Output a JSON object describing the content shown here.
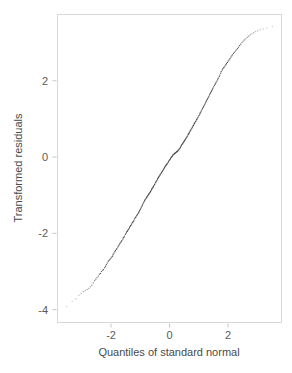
{
  "chart_data": {
    "type": "scatter",
    "title": "",
    "subtitle": "",
    "xlabel": "Quantiles of standard normal",
    "ylabel": "Transformed residuals",
    "xlim": [
      -3.85,
      3.85
    ],
    "ylim": [
      -4.35,
      3.75
    ],
    "xticks": [
      -2,
      0,
      2
    ],
    "xtick_labels": [
      "-2",
      "0",
      "2"
    ],
    "yticks": [
      2,
      0,
      -2,
      -4
    ],
    "ytick_labels": [
      "2",
      "0",
      "-2",
      "-4"
    ],
    "grid": false,
    "legend": null,
    "legend_position": "none",
    "annotations": [],
    "series": [
      {
        "name": "Transformed residuals vs normal quantiles",
        "marker": "point",
        "color": "#3b3b3b",
        "x": [
          -3.52,
          -3.33,
          -3.2,
          -3.1,
          -3.02,
          -2.95,
          -2.88,
          -2.82,
          -2.76,
          -2.71,
          -2.66,
          -2.61,
          -2.56,
          -2.52,
          -2.48,
          -2.44,
          -2.4,
          -2.36,
          -2.33,
          -2.29,
          -2.26,
          -2.22,
          -2.19,
          -2.16,
          -2.13,
          -2.1,
          -2.07,
          -2.04,
          -2.01,
          -1.98,
          -1.95,
          -1.93,
          -1.9,
          -1.87,
          -1.85,
          -1.82,
          -1.8,
          -1.77,
          -1.75,
          -1.72,
          -1.7,
          -1.67,
          -1.65,
          -1.63,
          -1.6,
          -1.58,
          -1.56,
          -1.54,
          -1.51,
          -1.49,
          -1.47,
          -1.45,
          -1.43,
          -1.41,
          -1.39,
          -1.37,
          -1.35,
          -1.33,
          -1.31,
          -1.29,
          -1.27,
          -1.25,
          -1.23,
          -1.21,
          -1.19,
          -1.17,
          -1.15,
          -1.13,
          -1.11,
          -1.09,
          -1.07,
          -1.05,
          -1.04,
          -1.02,
          -1.0,
          -0.98,
          -0.96,
          -0.94,
          -0.93,
          -0.91,
          -0.89,
          -0.87,
          -0.85,
          -0.84,
          -0.82,
          -0.8,
          -0.78,
          -0.77,
          -0.75,
          -0.73,
          -0.71,
          -0.7,
          -0.68,
          -0.66,
          -0.65,
          -0.63,
          -0.61,
          -0.6,
          -0.58,
          -0.56,
          -0.55,
          -0.53,
          -0.51,
          -0.5,
          -0.48,
          -0.46,
          -0.45,
          -0.43,
          -0.41,
          -0.4,
          -0.38,
          -0.37,
          -0.35,
          -0.33,
          -0.32,
          -0.3,
          -0.28,
          -0.27,
          -0.25,
          -0.24,
          -0.22,
          -0.2,
          -0.19,
          -0.17,
          -0.16,
          -0.14,
          -0.12,
          -0.11,
          -0.09,
          -0.08,
          -0.06,
          -0.04,
          -0.03,
          -0.01,
          0.01,
          0.03,
          0.04,
          0.06,
          0.08,
          0.09,
          0.11,
          0.12,
          0.14,
          0.16,
          0.17,
          0.19,
          0.2,
          0.22,
          0.24,
          0.25,
          0.27,
          0.28,
          0.3,
          0.32,
          0.33,
          0.35,
          0.37,
          0.38,
          0.4,
          0.41,
          0.43,
          0.45,
          0.46,
          0.48,
          0.5,
          0.51,
          0.53,
          0.55,
          0.56,
          0.58,
          0.6,
          0.61,
          0.63,
          0.65,
          0.66,
          0.68,
          0.7,
          0.71,
          0.73,
          0.75,
          0.77,
          0.78,
          0.8,
          0.82,
          0.84,
          0.85,
          0.87,
          0.89,
          0.91,
          0.93,
          0.94,
          0.96,
          0.98,
          1.0,
          1.02,
          1.04,
          1.05,
          1.07,
          1.09,
          1.11,
          1.13,
          1.15,
          1.17,
          1.19,
          1.21,
          1.23,
          1.25,
          1.27,
          1.29,
          1.31,
          1.33,
          1.35,
          1.37,
          1.39,
          1.41,
          1.43,
          1.45,
          1.47,
          1.49,
          1.51,
          1.54,
          1.56,
          1.58,
          1.6,
          1.63,
          1.65,
          1.67,
          1.7,
          1.72,
          1.75,
          1.77,
          1.8,
          1.82,
          1.85,
          1.87,
          1.9,
          1.93,
          1.95,
          1.98,
          2.01,
          2.04,
          2.07,
          2.1,
          2.13,
          2.16,
          2.19,
          2.22,
          2.26,
          2.29,
          2.33,
          2.36,
          2.4,
          2.44,
          2.48,
          2.52,
          2.56,
          2.61,
          2.66,
          2.71,
          2.76,
          2.82,
          2.88,
          2.95,
          3.02,
          3.1,
          3.2,
          3.33,
          3.52
        ],
        "y": [
          -3.92,
          -3.78,
          -3.72,
          -3.62,
          -3.58,
          -3.53,
          -3.5,
          -3.47,
          -3.44,
          -3.4,
          -3.36,
          -3.3,
          -3.24,
          -3.2,
          -3.16,
          -3.12,
          -3.07,
          -3.05,
          -3.0,
          -2.97,
          -2.95,
          -2.9,
          -2.86,
          -2.82,
          -2.78,
          -2.74,
          -2.71,
          -2.68,
          -2.65,
          -2.62,
          -2.6,
          -2.56,
          -2.52,
          -2.48,
          -2.45,
          -2.42,
          -2.4,
          -2.36,
          -2.33,
          -2.3,
          -2.27,
          -2.24,
          -2.21,
          -2.19,
          -2.15,
          -2.12,
          -2.1,
          -2.07,
          -2.03,
          -2.0,
          -1.97,
          -1.95,
          -1.93,
          -1.9,
          -1.88,
          -1.85,
          -1.82,
          -1.8,
          -1.78,
          -1.75,
          -1.72,
          -1.7,
          -1.68,
          -1.65,
          -1.62,
          -1.59,
          -1.57,
          -1.54,
          -1.52,
          -1.5,
          -1.47,
          -1.45,
          -1.43,
          -1.4,
          -1.37,
          -1.34,
          -1.31,
          -1.28,
          -1.26,
          -1.23,
          -1.2,
          -1.17,
          -1.14,
          -1.12,
          -1.1,
          -1.08,
          -1.06,
          -1.04,
          -1.02,
          -1.0,
          -0.98,
          -0.96,
          -0.94,
          -0.92,
          -0.9,
          -0.88,
          -0.85,
          -0.83,
          -0.81,
          -0.79,
          -0.77,
          -0.74,
          -0.72,
          -0.7,
          -0.67,
          -0.65,
          -0.63,
          -0.61,
          -0.58,
          -0.56,
          -0.54,
          -0.52,
          -0.5,
          -0.48,
          -0.46,
          -0.44,
          -0.42,
          -0.4,
          -0.38,
          -0.36,
          -0.34,
          -0.32,
          -0.3,
          -0.28,
          -0.26,
          -0.24,
          -0.22,
          -0.2,
          -0.19,
          -0.17,
          -0.15,
          -0.13,
          -0.11,
          -0.09,
          -0.07,
          -0.05,
          -0.03,
          -0.01,
          0.01,
          0.02,
          0.04,
          0.06,
          0.07,
          0.08,
          0.09,
          0.1,
          0.11,
          0.12,
          0.13,
          0.14,
          0.15,
          0.16,
          0.18,
          0.19,
          0.21,
          0.23,
          0.25,
          0.27,
          0.29,
          0.31,
          0.33,
          0.35,
          0.37,
          0.39,
          0.41,
          0.43,
          0.45,
          0.47,
          0.49,
          0.51,
          0.53,
          0.55,
          0.58,
          0.6,
          0.62,
          0.64,
          0.67,
          0.69,
          0.71,
          0.74,
          0.76,
          0.78,
          0.81,
          0.83,
          0.86,
          0.88,
          0.9,
          0.93,
          0.95,
          0.98,
          1.0,
          1.03,
          1.05,
          1.08,
          1.1,
          1.13,
          1.16,
          1.18,
          1.21,
          1.24,
          1.27,
          1.3,
          1.33,
          1.36,
          1.39,
          1.42,
          1.45,
          1.48,
          1.51,
          1.54,
          1.57,
          1.6,
          1.63,
          1.66,
          1.69,
          1.72,
          1.75,
          1.78,
          1.81,
          1.84,
          1.88,
          1.91,
          1.94,
          1.97,
          2.0,
          2.04,
          2.07,
          2.11,
          2.15,
          2.2,
          2.24,
          2.28,
          2.31,
          2.34,
          2.36,
          2.39,
          2.42,
          2.45,
          2.48,
          2.52,
          2.55,
          2.58,
          2.62,
          2.65,
          2.68,
          2.72,
          2.75,
          2.78,
          2.81,
          2.84,
          2.88,
          2.92,
          2.96,
          3.0,
          3.04,
          3.07,
          3.1,
          3.14,
          3.17,
          3.2,
          3.23,
          3.26,
          3.29,
          3.31,
          3.34,
          3.36,
          3.38,
          3.42
        ]
      }
    ]
  },
  "plot": {
    "frame": {
      "left": 57,
      "top": 14,
      "right": 282,
      "bottom": 323
    },
    "background_color": "#ffffff",
    "frame_color": "#d8d8d8",
    "point_color": "#3b3b3b",
    "text_color": "#5a5a5a"
  }
}
